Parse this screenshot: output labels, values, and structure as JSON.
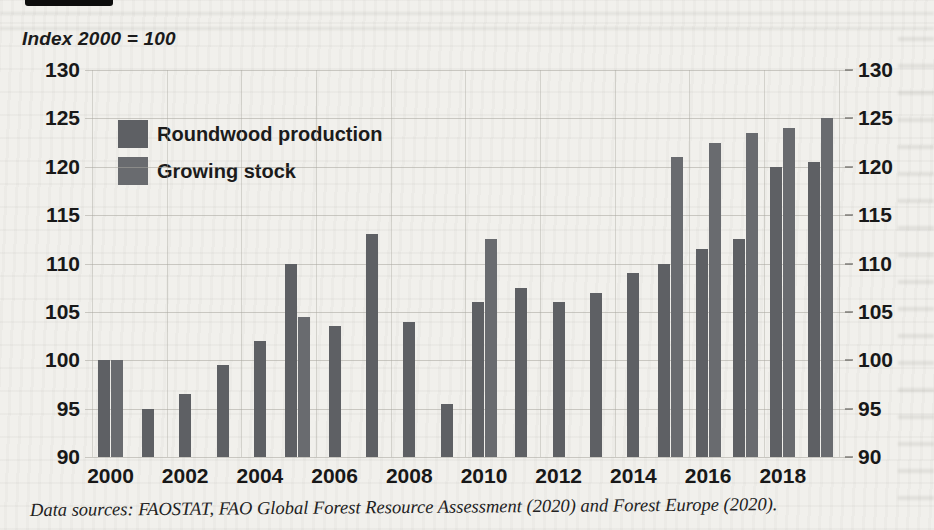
{
  "page": {
    "kind": "scanned book figure",
    "paper_color": "#f1f0ec",
    "ink_color": "#1b1b1b"
  },
  "caption": "Data sources: FAOSTAT, FAO Global Forest Resource Assessment (2020) and Forest Europe (2020).",
  "chart_data": {
    "type": "bar",
    "title": "Index 2000 = 100",
    "xlabel": "",
    "ylabel": "",
    "ylim": [
      90,
      130
    ],
    "ytick_step": 5,
    "ytick_labels": [
      "90",
      "95",
      "100",
      "105",
      "110",
      "115",
      "120",
      "125",
      "130"
    ],
    "y_axis_sides": [
      "left",
      "right"
    ],
    "grid": true,
    "legend_position": "top-left",
    "categories": [
      "2000",
      "2001",
      "2002",
      "2003",
      "2004",
      "2005",
      "2006",
      "2007",
      "2008",
      "2009",
      "2010",
      "2011",
      "2012",
      "2013",
      "2014",
      "2015",
      "2016",
      "2017",
      "2018",
      "2019"
    ],
    "xtick_labels": [
      "2000",
      "2002",
      "2004",
      "2006",
      "2008",
      "2010",
      "2012",
      "2014",
      "2016",
      "2018"
    ],
    "series": [
      {
        "name": "Roundwood production",
        "color": "#5e6064",
        "values": [
          100,
          95,
          96.5,
          99.5,
          102,
          110,
          103.5,
          113,
          104,
          95.5,
          106,
          107.5,
          106,
          107,
          109,
          110,
          111.5,
          112.5,
          120,
          120.5
        ]
      },
      {
        "name": "Growing stock",
        "color": "#696b6f",
        "values": [
          100,
          null,
          null,
          null,
          null,
          104.5,
          null,
          null,
          null,
          null,
          112.5,
          null,
          null,
          null,
          null,
          121,
          122.5,
          123.5,
          124,
          125
        ]
      }
    ]
  }
}
